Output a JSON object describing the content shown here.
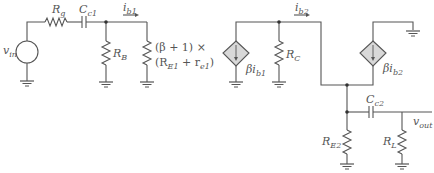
{
  "figure": {
    "left_circuit": {
      "source_label": "v",
      "source_sub": "in",
      "rg_label": "R",
      "rg_sub": "g",
      "cc1_label": "C",
      "cc1_sub": "c1",
      "ib1_label": "i",
      "ib1_sub": "b1",
      "rb_label": "R",
      "rb_sub": "B",
      "reflected_line1": "(β + 1) ×",
      "reflected_line2_pre": "(R",
      "reflected_line2_sub1": "E1",
      "reflected_line2_mid": " + r",
      "reflected_line2_sub2": "e1",
      "reflected_line2_post": ")"
    },
    "right_circuit": {
      "ib2_label": "i",
      "ib2_sub": "b2",
      "dep_source1_label": "βi",
      "dep_source1_sub": "b1",
      "rc_label": "R",
      "rc_sub": "C",
      "dep_source2_label": "βi",
      "dep_source2_sub": "b2",
      "cc2_label": "C",
      "cc2_sub": "c2",
      "re2_label": "R",
      "re2_sub": "E2",
      "rl_label": "R",
      "rl_sub": "L",
      "vout_label": "v",
      "vout_sub": "out"
    },
    "colors": {
      "wire": "#555555",
      "dep_source_fill": "#d8d8d8",
      "text": "#555555"
    }
  }
}
